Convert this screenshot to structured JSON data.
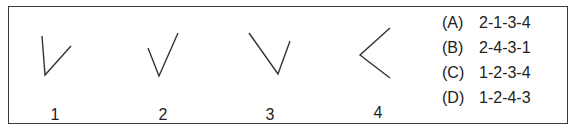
{
  "figures": [
    {
      "label": "1",
      "points": [
        [
          42,
          36
        ],
        [
          45,
          75
        ],
        [
          71,
          46
        ]
      ],
      "label_x": 55
    },
    {
      "label": "2",
      "points": [
        [
          148,
          48
        ],
        [
          159,
          76
        ],
        [
          178,
          33
        ]
      ],
      "label_x": 163
    },
    {
      "label": "3",
      "points": [
        [
          249,
          33
        ],
        [
          278,
          74
        ],
        [
          290,
          41
        ]
      ],
      "label_x": 270
    },
    {
      "label": "4",
      "points": [
        [
          390,
          28
        ],
        [
          360,
          55
        ],
        [
          390,
          78
        ]
      ],
      "label_x": 378
    }
  ],
  "options": [
    {
      "key": "(A)",
      "value": "2-1-3-4"
    },
    {
      "key": "(B)",
      "value": "2-4-3-1"
    },
    {
      "key": "(C)",
      "value": "1-2-3-4"
    },
    {
      "key": "(D)",
      "value": "1-2-4-3"
    }
  ]
}
